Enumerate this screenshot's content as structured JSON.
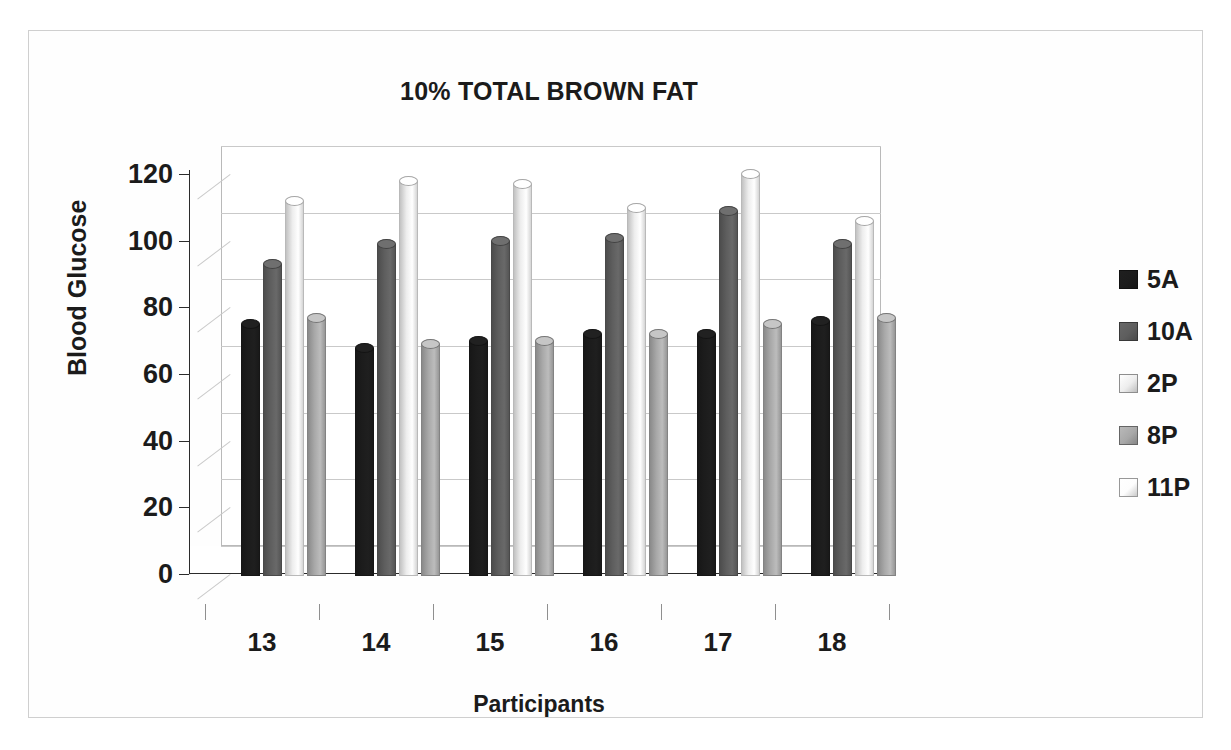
{
  "figure": {
    "title": "10% TOTAL BROWN FAT"
  },
  "legend": {
    "position": "right",
    "items": [
      {
        "label": "5A",
        "color": "#1c1c1c"
      },
      {
        "label": "10A",
        "color": "#5e5e5e"
      },
      {
        "label": "2P",
        "color": "#ededed"
      },
      {
        "label": "8P",
        "color": "#a8a8a8"
      },
      {
        "label": "11P",
        "color": "#fdfdfd"
      }
    ]
  },
  "axes": {
    "y_title": "Blood Glucose",
    "x_title": "Participants",
    "y_ticks": [
      "0",
      "20",
      "40",
      "60",
      "80",
      "100",
      "120"
    ],
    "x_ticks": [
      "13",
      "14",
      "15",
      "16",
      "17",
      "18"
    ]
  },
  "chart_data": {
    "type": "bar",
    "title": "10% TOTAL BROWN FAT",
    "xlabel": "Participants",
    "ylabel": "Blood Glucose",
    "categories": [
      "13",
      "14",
      "15",
      "16",
      "17",
      "18"
    ],
    "ylim": [
      0,
      120
    ],
    "ytick_step": 20,
    "grid": true,
    "legend_position": "right",
    "style": "3d-cylinder",
    "series": [
      {
        "name": "5A",
        "color": "#1c1c1c",
        "values": [
          77,
          70,
          72,
          74,
          74,
          78
        ]
      },
      {
        "name": "10A",
        "color": "#5e5e5e",
        "values": [
          95,
          101,
          102,
          103,
          111,
          101
        ]
      },
      {
        "name": "2P",
        "color": "#ededed",
        "values": [
          114,
          120,
          119,
          112,
          122,
          108
        ]
      },
      {
        "name": "8P",
        "color": "#a8a8a8",
        "values": [
          79,
          71,
          72,
          74,
          77,
          79
        ]
      },
      {
        "name": "11P",
        "color": "#fdfdfd",
        "values": [
          null,
          null,
          null,
          null,
          null,
          null
        ]
      }
    ]
  }
}
